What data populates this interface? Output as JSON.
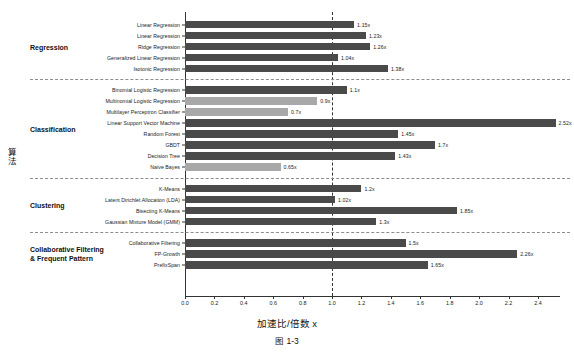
{
  "chart_data": {
    "type": "bar",
    "orientation": "horizontal",
    "title": "",
    "xlabel": "加速比/倍数 x",
    "ylabel": "算法",
    "caption": "图 1-3",
    "xlim": [
      0.0,
      2.55
    ],
    "xticks": [
      "0.0",
      "0.2",
      "0.4",
      "0.6",
      "0.8",
      "1.0",
      "1.2",
      "1.4",
      "1.6",
      "1.8",
      "2.0",
      "2.2",
      "2.4"
    ],
    "xtick_values": [
      0.0,
      0.2,
      0.4,
      0.6,
      0.8,
      1.0,
      1.2,
      1.4,
      1.6,
      1.8,
      2.0,
      2.2,
      2.4
    ],
    "grid": false,
    "legend": "none",
    "reference_line": 1.0,
    "colors": {
      "bar_above": "#4a4a4a",
      "bar_below": "#a8a8a8",
      "axis": "#333333",
      "separator": "#8d8d8d"
    },
    "groups": [
      {
        "name": "Regression",
        "categories": [
          "Linear Regression",
          "Linear Regression",
          "Ridge Regression",
          "Generalized Linear Regression",
          "Isotonic Regression"
        ],
        "values": [
          1.15,
          1.23,
          1.26,
          1.04,
          1.38
        ],
        "labels": [
          "1.15x",
          "1.23x",
          "1.26x",
          "1.04x",
          "1.38x"
        ]
      },
      {
        "name": "Classification",
        "categories": [
          "Binomial Logistic Regression",
          "Multinomial Logistic Regression",
          "Multilayer Perceptron Classifier",
          "Linear Support Vector Machine",
          "Random Forest",
          "GBDT",
          "Decision Tree",
          "Naive Bayes"
        ],
        "values": [
          1.1,
          0.9,
          0.7,
          2.52,
          1.45,
          1.7,
          1.43,
          0.65
        ],
        "labels": [
          "1.1x",
          "0.9x",
          "0.7x",
          "2.52x",
          "1.45x",
          "1.7x",
          "1.43x",
          "0.65x"
        ]
      },
      {
        "name": "Clustering",
        "categories": [
          "K-Means",
          "Latent Dirichlet Allocation (LDA)",
          "Bisecting K-Means",
          "Gaussian Mixture Model (GMM)"
        ],
        "values": [
          1.2,
          1.02,
          1.85,
          1.3
        ],
        "labels": [
          "1.2x",
          "1.02x",
          "1.85x",
          "1.3x"
        ]
      },
      {
        "name": "Collaborative Filtering\n& Frequent Pattern",
        "group_label_lines": [
          "Collaborative Filtering",
          "& Frequent Pattern"
        ],
        "categories": [
          "Collaborative Filtering",
          "FP-Growth",
          "PrefixSpan"
        ],
        "values": [
          1.5,
          2.26,
          1.65
        ],
        "labels": [
          "1.5x",
          "2.26x",
          "1.65x"
        ]
      }
    ]
  }
}
